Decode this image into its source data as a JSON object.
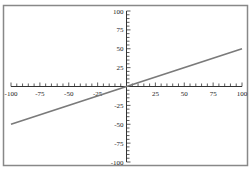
{
  "chart_data": {
    "type": "line",
    "title": "",
    "xlabel": "",
    "ylabel": "",
    "xlim": [
      -100,
      100
    ],
    "ylim": [
      -100,
      100
    ],
    "grid": false,
    "legend": null,
    "axes_through_origin": true,
    "x_ticks": [
      -100,
      -75,
      -50,
      -25,
      25,
      50,
      75,
      100
    ],
    "x_tick_labels": [
      "-100",
      "-75",
      "-50",
      "-25",
      "25",
      "50",
      "75",
      "100"
    ],
    "y_ticks": [
      100,
      75,
      50,
      25,
      -25,
      -50,
      -75,
      -100
    ],
    "y_tick_labels": [
      "100",
      "75",
      "50",
      "25",
      "-25",
      "-50",
      "-75",
      "-100"
    ],
    "minor_tick_step": 5,
    "series": [
      {
        "name": "y = 0.5x",
        "x": [
          -100,
          100
        ],
        "y": [
          -50,
          50
        ],
        "color": "#7a7a7a"
      }
    ]
  },
  "colors": {
    "frame": "#888888",
    "axis": "#333333",
    "line": "#7a7a7a",
    "background": "#ffffff"
  }
}
